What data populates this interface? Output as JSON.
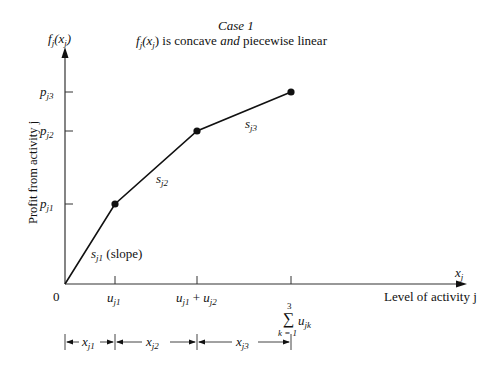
{
  "title": {
    "line1": "Case 1",
    "line2_prefix": "f",
    "line2_sub": "j",
    "line2_mid": "(x",
    "line2_sub2": "j",
    "line2_after": ")",
    "line2_text1": " is concave ",
    "line2_and": "and",
    "line2_text2": " piecewise linear"
  },
  "axes": {
    "y_symbol": "f",
    "y_symbol_sub": "j",
    "y_symbol_arg": "(x",
    "y_symbol_arg_sub": "j",
    "y_symbol_close": ")",
    "y_label": "Profit from activity j",
    "x_symbol": "x",
    "x_symbol_sub": "j",
    "x_label": "Level of activity j",
    "origin_label": "0"
  },
  "y_ticks": [
    {
      "base": "p",
      "sub": "j1"
    },
    {
      "base": "p",
      "sub": "j2"
    },
    {
      "base": "p",
      "sub": "j3"
    }
  ],
  "x_ticks": [
    {
      "text": "u",
      "sub": "j1"
    },
    {
      "text": "u",
      "sub": "j1",
      "plus": " + ",
      "text2": "u",
      "sub2": "j2"
    },
    {
      "sum_top": "3",
      "sum_sym": "∑",
      "sum_bottom": "k = 1",
      "text": "u",
      "sub": "jk"
    }
  ],
  "segments": [
    {
      "label_base": "s",
      "label_sub": "j1",
      "note": " (slope)"
    },
    {
      "label_base": "s",
      "label_sub": "j2"
    },
    {
      "label_base": "s",
      "label_sub": "j3"
    }
  ],
  "dimensions": [
    {
      "base": "x",
      "sub": "j1"
    },
    {
      "base": "x",
      "sub": "j2"
    },
    {
      "base": "x",
      "sub": "j3"
    }
  ],
  "colors": {
    "line": "#111111",
    "axis": "#333333",
    "background": "#ffffff"
  }
}
